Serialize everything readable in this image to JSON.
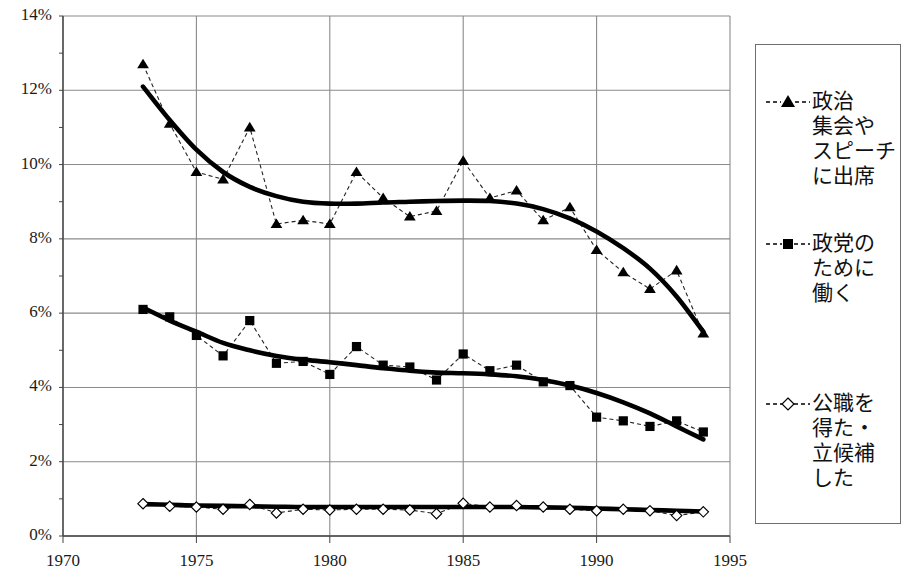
{
  "chart_data": {
    "type": "line",
    "title": "",
    "xlabel": "",
    "ylabel": "",
    "xlim": [
      1970,
      1995
    ],
    "ylim": [
      0,
      14
    ],
    "grid": true,
    "legend_position": "right",
    "x_ticks": [
      "1970",
      "1975",
      "1980",
      "1985",
      "1990",
      "1995"
    ],
    "y_ticks": [
      "0%",
      "2%",
      "4%",
      "6%",
      "8%",
      "10%",
      "12%",
      "14%"
    ],
    "x": [
      1973,
      1974,
      1975,
      1976,
      1977,
      1978,
      1979,
      1980,
      1981,
      1982,
      1983,
      1984,
      1985,
      1986,
      1987,
      1988,
      1989,
      1990,
      1991,
      1992,
      1993,
      1994
    ],
    "series": [
      {
        "name": "政治集会やスピーチに出席",
        "marker": "triangle",
        "line": "dashed",
        "trend": "thick-smooth",
        "values": [
          12.7,
          11.1,
          9.8,
          9.6,
          11.0,
          8.4,
          8.5,
          8.4,
          9.8,
          9.1,
          8.6,
          8.75,
          10.1,
          9.1,
          9.3,
          8.5,
          8.85,
          7.7,
          7.1,
          6.65,
          7.15,
          5.45
        ],
        "trend_values": [
          12.1,
          11.2,
          10.4,
          9.8,
          9.4,
          9.15,
          9.0,
          8.95,
          8.95,
          8.98,
          9.0,
          9.02,
          9.03,
          9.02,
          8.95,
          8.8,
          8.55,
          8.2,
          7.75,
          7.2,
          6.45,
          5.5
        ]
      },
      {
        "name": "政党のために働く",
        "marker": "square",
        "line": "dashed",
        "trend": "thick-smooth",
        "values": [
          6.1,
          5.9,
          5.4,
          4.85,
          5.8,
          4.65,
          4.7,
          4.35,
          5.1,
          4.6,
          4.55,
          4.2,
          4.9,
          4.45,
          4.6,
          4.15,
          4.05,
          3.2,
          3.1,
          2.95,
          3.1,
          2.8
        ],
        "trend_values": [
          6.15,
          5.8,
          5.5,
          5.2,
          5.0,
          4.85,
          4.75,
          4.68,
          4.6,
          4.52,
          4.45,
          4.4,
          4.38,
          4.35,
          4.3,
          4.2,
          4.05,
          3.85,
          3.6,
          3.3,
          2.95,
          2.6
        ]
      },
      {
        "name": "公職を得た・立候補した",
        "marker": "diamond",
        "line": "dashed",
        "trend": "thick-smooth",
        "values": [
          0.87,
          0.8,
          0.78,
          0.72,
          0.85,
          0.62,
          0.72,
          0.7,
          0.72,
          0.72,
          0.7,
          0.6,
          0.88,
          0.78,
          0.82,
          0.78,
          0.72,
          0.68,
          0.72,
          0.68,
          0.55,
          0.65
        ],
        "trend_values": [
          0.86,
          0.84,
          0.82,
          0.81,
          0.8,
          0.79,
          0.78,
          0.78,
          0.78,
          0.78,
          0.78,
          0.78,
          0.78,
          0.78,
          0.78,
          0.77,
          0.76,
          0.74,
          0.72,
          0.7,
          0.68,
          0.66
        ]
      }
    ]
  },
  "axes": {
    "y_ticks": [
      {
        "label": "14%",
        "value": 14
      },
      {
        "label": "12%",
        "value": 12
      },
      {
        "label": "10%",
        "value": 10
      },
      {
        "label": "8%",
        "value": 8
      },
      {
        "label": "6%",
        "value": 6
      },
      {
        "label": "4%",
        "value": 4
      },
      {
        "label": "2%",
        "value": 2
      },
      {
        "label": "0%",
        "value": 0
      }
    ],
    "x_ticks": [
      {
        "label": "1970",
        "value": 1970
      },
      {
        "label": "1975",
        "value": 1975
      },
      {
        "label": "1980",
        "value": 1980
      },
      {
        "label": "1985",
        "value": 1985
      },
      {
        "label": "1990",
        "value": 1990
      },
      {
        "label": "1995",
        "value": 1995
      }
    ]
  },
  "legend": {
    "items": [
      {
        "marker": "triangle",
        "label": "政治\n集会や\nスピーチ\nに出席",
        "lines": [
          "政治",
          "集会や",
          "スピーチ",
          "に出席"
        ]
      },
      {
        "marker": "square",
        "label": "政党の\nために\n働く",
        "lines": [
          "政党の",
          "ために",
          "働く"
        ]
      },
      {
        "marker": "diamond",
        "label": "公職を\n得た・\n立候補\nした",
        "lines": [
          "公職を",
          "得た・",
          "立候補",
          "した"
        ]
      }
    ]
  },
  "colors": {
    "axis": "#555555",
    "grid": "#8a8a8a",
    "series": "#000000",
    "background": "#ffffff",
    "legend_border": "#6e6e6e"
  }
}
